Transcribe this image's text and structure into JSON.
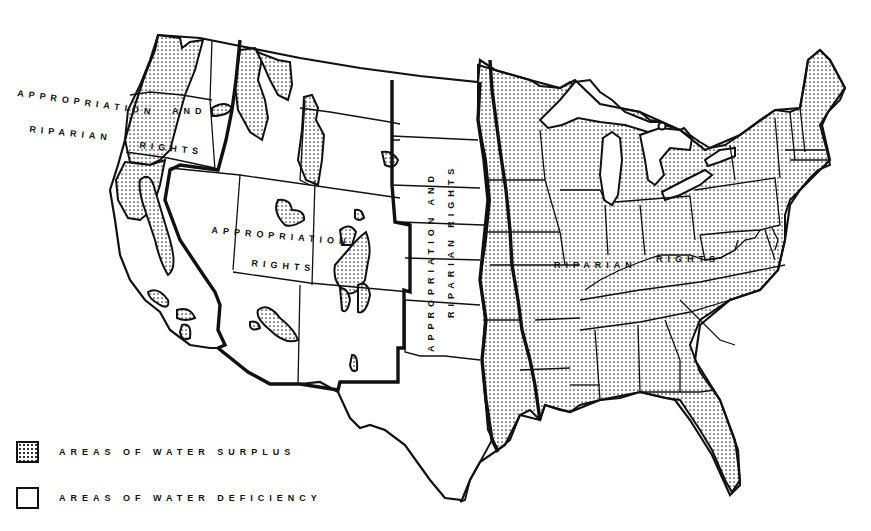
{
  "map": {
    "subject": "United States water rights doctrines and water surplus/deficiency areas",
    "region_labels": {
      "west_coast_line1": "APPROPRIATION AND",
      "west_coast_line1a": "APPROPRIATION",
      "west_coast_line1b": "AND",
      "west_coast_line2": "RIPARIAN",
      "west_coast_line3": "RIGHTS",
      "interior_west_line1": "APPROPRIATION",
      "interior_west_line2": "RIGHTS",
      "plains_line1": "APPROPRIATION AND",
      "plains_line2": "RIPARIAN RIGHTS",
      "east_line1": "RIPARIAN",
      "east_line2": "RIGHTS"
    },
    "colors": {
      "outline": "#111111",
      "surplus_dots": "#333333",
      "background": "#ffffff"
    }
  },
  "legend": {
    "items": [
      {
        "label": "AREAS OF WATER SURPLUS",
        "pattern": "dotted"
      },
      {
        "label": "AREAS OF WATER DEFICIENCY",
        "pattern": "blank"
      }
    ]
  }
}
